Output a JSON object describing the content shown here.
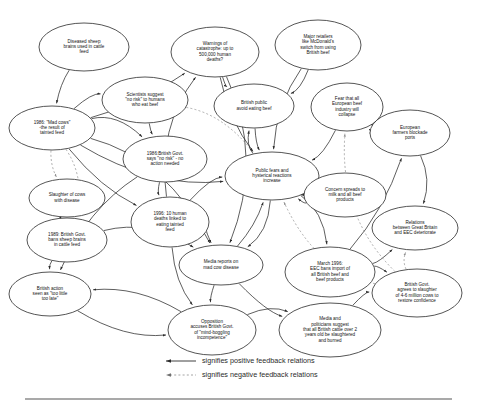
{
  "figure": {
    "background_color": "#ffffff",
    "line_color": "#2a2a2a",
    "negative_line_color": "#8d8d8d"
  },
  "legend": {
    "positive": {
      "label": "signifies positive feedback relations",
      "style": "solid-arrow"
    },
    "negative": {
      "label": "signifies negative feedback relations",
      "style": "dotted-arrow"
    }
  },
  "nodes": [
    {
      "id": "diseased_sheep",
      "label": "Diseased sheep brains used in cattle feed",
      "lines": [
        "Diseased sheep",
        "brains used in cattle",
        "feed"
      ],
      "cx": 84,
      "cy": 47,
      "rx": 45,
      "ry": 24
    },
    {
      "id": "warnings",
      "label": "Warnings of catastrophe: up to 500,000 human deaths?",
      "lines": [
        "Warnings of",
        "catastrophe: up to",
        "500,000 human",
        "deaths?"
      ],
      "cx": 215,
      "cy": 52,
      "rx": 44,
      "ry": 25
    },
    {
      "id": "retailers",
      "label": "Major retailers like McDonald's switch from using British beef",
      "lines": [
        "Major retailers",
        "like McDonald's",
        "switch from using",
        "British beef"
      ],
      "cx": 318,
      "cy": 45,
      "rx": 43,
      "ry": 25
    },
    {
      "id": "scientists",
      "label": "Scientists suggest \"no risk\" to humans who eat beef",
      "lines": [
        "Scientists suggest",
        "\"no risk\" to humans",
        "who eat beef"
      ],
      "cx": 145,
      "cy": 100,
      "rx": 43,
      "ry": 23
    },
    {
      "id": "public_avoid",
      "label": "British public avoid eating beef",
      "lines": [
        "British public",
        "avoid eating beef"
      ],
      "cx": 254,
      "cy": 106,
      "rx": 40,
      "ry": 22
    },
    {
      "id": "fear_european",
      "label": "Fear that all European beef industry will collapse",
      "lines": [
        "Fear that all",
        "European beef",
        "industry will",
        "collapse"
      ],
      "cx": 347,
      "cy": 107,
      "rx": 36,
      "ry": 24
    },
    {
      "id": "mad_cows",
      "label": "1986: \"Mad cows\" -the result of tainted feed",
      "lines": [
        "1986: \"Mad cows\"",
        "-the result of",
        "tainted feed"
      ],
      "cx": 52,
      "cy": 128,
      "rx": 43,
      "ry": 22
    },
    {
      "id": "blockade",
      "label": "European farmers blockade ports",
      "lines": [
        "European",
        "farmers blockade",
        "ports"
      ],
      "cx": 410,
      "cy": 133,
      "rx": 40,
      "ry": 23
    },
    {
      "id": "govt_no_risk",
      "label": "1986:British Govt. says \"no risk\" - no action needed",
      "lines": [
        "1986:British Govt.",
        "says \"no risk\" - no",
        "action needed"
      ],
      "cx": 165,
      "cy": 159,
      "rx": 42,
      "ry": 23
    },
    {
      "id": "public_fears",
      "label": "Public fears and hysterical reactions increase",
      "lines": [
        "Public fears and",
        "hysterical reactions",
        "increase"
      ],
      "cx": 272,
      "cy": 176,
      "rx": 47,
      "ry": 24
    },
    {
      "id": "concern_milk",
      "label": "Concern spreads to milk and all beef products",
      "lines": [
        "Concern spreads to",
        "milk and all beef",
        "products"
      ],
      "cx": 345,
      "cy": 195,
      "rx": 41,
      "ry": 22
    },
    {
      "id": "slaughter_cows",
      "label": "Slaughter of cows with disease",
      "lines": [
        "Slaughter of cows",
        "with disease"
      ],
      "cx": 67,
      "cy": 198,
      "rx": 38,
      "ry": 19
    },
    {
      "id": "deaths_10",
      "label": "1996: 10 human deaths linked to eating tainted feed",
      "lines": [
        "1996: 10 human",
        "deaths linked to",
        "eating tainted",
        "feed"
      ],
      "cx": 170,
      "cy": 222,
      "rx": 39,
      "ry": 25
    },
    {
      "id": "relations_eec",
      "label": "Relations between Great Britain and EEC deteriorate",
      "lines": [
        "Relations",
        "between Great Britain",
        "and EEC deteriorate"
      ],
      "cx": 415,
      "cy": 228,
      "rx": 43,
      "ry": 22
    },
    {
      "id": "bans_sheep",
      "label": "1989: British Govt. bans sheep brains in cattle feed",
      "lines": [
        "1989: British Govt.",
        "bans sheep brains",
        "in cattle feed"
      ],
      "cx": 67,
      "cy": 240,
      "rx": 40,
      "ry": 22
    },
    {
      "id": "media_reports",
      "label": "Media reports on mad cow disease",
      "lines": [
        "Media reports on",
        "mad cow disease"
      ],
      "cx": 221,
      "cy": 265,
      "rx": 42,
      "ry": 20
    },
    {
      "id": "eec_bans",
      "label": "March 1996: EEC bans import of all British beef and beef products",
      "lines": [
        "March 1996:",
        "EEC bans import of",
        "all British beef and",
        "beef products"
      ],
      "cx": 330,
      "cy": 272,
      "rx": 45,
      "ry": 25
    },
    {
      "id": "too_little",
      "label": "British action seen as \"too little too late\"",
      "lines": [
        "British action",
        "seen as \"too little",
        "too late\""
      ],
      "cx": 50,
      "cy": 294,
      "rx": 41,
      "ry": 22
    },
    {
      "id": "govt_slaughter",
      "label": "British Govt. agrees to slaughter of 4-6 million cows to restore confidence",
      "lines": [
        "British Govt.",
        "agrees to slaughter",
        "of 4-6 million cows to",
        "restore confidence"
      ],
      "cx": 417,
      "cy": 293,
      "rx": 45,
      "ry": 24
    },
    {
      "id": "opposition",
      "label": "Opposition accuses British Govt. of \"mind-boggling incompetence\"",
      "lines": [
        "Opposition",
        "accuses British Govt.",
        "of \"mind-boggling",
        "incompetence\""
      ],
      "cx": 212,
      "cy": 330,
      "rx": 44,
      "ry": 25
    },
    {
      "id": "media_politician",
      "label": "Media and politicians suggest that all British cattle over 2 years old be slaughtered and burned",
      "lines": [
        "Media and",
        "politicians suggest",
        "that all British cattle over 2",
        "years old be slaughtered",
        "and burned"
      ],
      "cx": 330,
      "cy": 330,
      "rx": 51,
      "ry": 27
    }
  ],
  "edges": [
    {
      "from": "diseased_sheep",
      "to": "mad_cows",
      "type": "positive"
    },
    {
      "from": "mad_cows",
      "to": "scientists",
      "type": "positive"
    },
    {
      "from": "mad_cows",
      "to": "govt_no_risk",
      "type": "positive"
    },
    {
      "from": "mad_cows",
      "to": "slaughter_cows",
      "type": "negative"
    },
    {
      "from": "mad_cows",
      "to": "bans_sheep",
      "type": "negative"
    },
    {
      "from": "mad_cows",
      "to": "deaths_10",
      "type": "positive"
    },
    {
      "from": "mad_cows",
      "to": "media_reports",
      "type": "positive"
    },
    {
      "from": "mad_cows",
      "to": "public_fears",
      "type": "positive"
    },
    {
      "from": "mad_cows",
      "to": "warnings",
      "type": "positive"
    },
    {
      "from": "scientists",
      "to": "govt_no_risk",
      "type": "positive"
    },
    {
      "from": "scientists",
      "to": "public_fears",
      "type": "negative"
    },
    {
      "from": "govt_no_risk",
      "to": "too_little",
      "type": "positive"
    },
    {
      "from": "govt_no_risk",
      "to": "deaths_10",
      "type": "positive"
    },
    {
      "from": "deaths_10",
      "to": "media_reports",
      "type": "positive"
    },
    {
      "from": "deaths_10",
      "to": "warnings",
      "type": "positive"
    },
    {
      "from": "deaths_10",
      "to": "public_fears",
      "type": "positive"
    },
    {
      "from": "deaths_10",
      "to": "opposition",
      "type": "positive"
    },
    {
      "from": "warnings",
      "to": "public_avoid",
      "type": "positive"
    },
    {
      "from": "warnings",
      "to": "public_fears",
      "type": "positive"
    },
    {
      "from": "warnings",
      "to": "media_reports",
      "type": "positive"
    },
    {
      "from": "retailers",
      "to": "public_avoid",
      "type": "positive"
    },
    {
      "from": "retailers",
      "to": "public_fears",
      "type": "positive"
    },
    {
      "from": "public_avoid",
      "to": "public_fears",
      "type": "positive"
    },
    {
      "from": "public_fears",
      "to": "public_avoid",
      "type": "positive"
    },
    {
      "from": "public_fears",
      "to": "concern_milk",
      "type": "positive"
    },
    {
      "from": "public_fears",
      "to": "media_reports",
      "type": "positive"
    },
    {
      "from": "public_fears",
      "to": "eec_bans",
      "type": "positive"
    },
    {
      "from": "concern_milk",
      "to": "public_fears",
      "type": "positive"
    },
    {
      "from": "fear_european",
      "to": "blockade",
      "type": "positive"
    },
    {
      "from": "fear_european",
      "to": "public_fears",
      "type": "positive"
    },
    {
      "from": "blockade",
      "to": "fear_european",
      "type": "positive"
    },
    {
      "from": "blockade",
      "to": "relations_eec",
      "type": "positive"
    },
    {
      "from": "eec_bans",
      "to": "blockade",
      "type": "positive"
    },
    {
      "from": "eec_bans",
      "to": "relations_eec",
      "type": "positive"
    },
    {
      "from": "eec_bans",
      "to": "govt_slaughter",
      "type": "positive"
    },
    {
      "from": "media_reports",
      "to": "public_fears",
      "type": "positive"
    },
    {
      "from": "media_reports",
      "to": "opposition",
      "type": "positive"
    },
    {
      "from": "media_reports",
      "to": "media_politician",
      "type": "positive"
    },
    {
      "from": "bans_sheep",
      "to": "too_little",
      "type": "positive"
    },
    {
      "from": "bans_sheep",
      "to": "media_reports",
      "type": "positive"
    },
    {
      "from": "slaughter_cows",
      "to": "bans_sheep",
      "type": "positive"
    },
    {
      "from": "too_little",
      "to": "opposition",
      "type": "positive"
    },
    {
      "from": "opposition",
      "to": "media_politician",
      "type": "positive"
    },
    {
      "from": "opposition",
      "to": "too_little",
      "type": "positive"
    },
    {
      "from": "media_politician",
      "to": "govt_slaughter",
      "type": "positive"
    },
    {
      "from": "govt_slaughter",
      "to": "relations_eec",
      "type": "negative"
    },
    {
      "from": "govt_slaughter",
      "to": "public_fears",
      "type": "negative"
    },
    {
      "from": "govt_slaughter",
      "to": "fear_european",
      "type": "negative"
    }
  ]
}
